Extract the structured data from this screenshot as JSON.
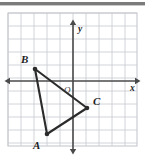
{
  "figure": {
    "top_rule_color": "#7b7b7b",
    "background_color": "#ffffff",
    "grid_color": "#c6c9cf",
    "grid_border_color": "#bfc3c9",
    "axis_color": "#4a4a4a",
    "shape_color": "#2b2b2b"
  },
  "axes": {
    "x_label": "x",
    "y_label": "y",
    "origin_label": "O",
    "grid_spacing_px": 13,
    "origin_px": {
      "x": 73,
      "y": 74
    },
    "x_axis_from_px": {
      "x": 9,
      "y": 74
    },
    "x_axis_to_px": {
      "x": 136,
      "y": 74
    },
    "y_axis_from_px": {
      "x": 73,
      "y": 17
    },
    "y_axis_to_px": {
      "x": 73,
      "y": 143
    },
    "x_label_px": {
      "x": 130,
      "y": 84
    },
    "y_label_px": {
      "x": 78,
      "y": 25
    },
    "origin_label_px": {
      "x": 64,
      "y": 86
    }
  },
  "grid": {
    "left_px": 8,
    "top_px": 13,
    "right_px": 137,
    "bottom_px": 146,
    "columns": 10,
    "rows": 10
  },
  "chart_data": {
    "type": "scatter",
    "xlabel": "x",
    "ylabel": "y",
    "xlim": [
      -5,
      5
    ],
    "ylim": [
      -5.5,
      4.5
    ],
    "grid": true,
    "legend": false,
    "points": [
      {
        "label": "B",
        "x": -3,
        "y": 1,
        "px": 35,
        "py": 62,
        "label_px": {
          "x": 21,
          "y": 56
        }
      },
      {
        "label": "A",
        "x": -2,
        "y": -4.6,
        "px": 47,
        "py": 127,
        "label_px": {
          "x": 33,
          "y": 142
        }
      },
      {
        "label": "C",
        "x": 1.1,
        "y": -2.6,
        "px": 87,
        "py": 101,
        "label_px": {
          "x": 93,
          "y": 98
        }
      }
    ],
    "edges": [
      {
        "from": "B",
        "to": "A"
      },
      {
        "from": "B",
        "to": "C"
      },
      {
        "from": "A",
        "to": "C"
      }
    ]
  }
}
